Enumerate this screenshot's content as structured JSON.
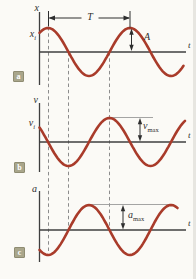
{
  "colors": {
    "background": "#fbfaf6",
    "curve": "#a93b2a",
    "axis": "#3f3f3f",
    "dash": "#8c8c8c",
    "annotation": "#2e2e2e",
    "ref_line": "#9a9a9a",
    "tag_bg": "#a9a68b",
    "tag_text": "#ffffff"
  },
  "panels": [
    {
      "tag": "a",
      "y_axis_label": "x",
      "t_axis_label": "t",
      "initial_value_label": {
        "base": "x",
        "sub": "i"
      },
      "waveform": "cosine",
      "annotations": [
        {
          "name": "period",
          "label": "T"
        },
        {
          "name": "amplitude",
          "label": "A"
        }
      ]
    },
    {
      "tag": "b",
      "y_axis_label": "v",
      "t_axis_label": "t",
      "initial_value_label": {
        "base": "v",
        "sub": "i"
      },
      "waveform": "negative-sine",
      "annotations": [
        {
          "name": "max-velocity",
          "label": {
            "base": "v",
            "sub": "max"
          }
        }
      ]
    },
    {
      "tag": "c",
      "y_axis_label": "a",
      "t_axis_label": "t",
      "waveform": "negative-cosine",
      "annotations": [
        {
          "name": "max-acceleration",
          "label": {
            "base": "a",
            "sub": "max"
          }
        }
      ]
    }
  ],
  "chart_data": [
    {
      "type": "line",
      "title": "position vs time (simple harmonic motion)",
      "xlabel": "t",
      "ylabel": "x",
      "function": "x(t) = A cos(2π t / T + φ)",
      "amplitude_label": "A",
      "period_label": "T",
      "initial_value_label": "x_i",
      "periods_shown": 1.75,
      "first_peak_fraction_of_period": 0.1
    },
    {
      "type": "line",
      "title": "velocity vs time (simple harmonic motion)",
      "xlabel": "t",
      "ylabel": "v",
      "function": "v(t) = -v_max sin(2π t / T + φ)",
      "amplitude_label": "v_max",
      "initial_value_label": "v_i",
      "periods_shown": 1.75,
      "phase_lead_vs_position": "quarter period"
    },
    {
      "type": "line",
      "title": "acceleration vs time (simple harmonic motion)",
      "xlabel": "t",
      "ylabel": "a",
      "function": "a(t) = -a_max cos(2π t / T + φ)",
      "amplitude_label": "a_max",
      "periods_shown": 1.65,
      "phase_vs_position": "inverted (half period shift)"
    }
  ]
}
